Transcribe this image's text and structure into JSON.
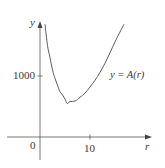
{
  "chart_data": {
    "type": "line",
    "title": "",
    "xlabel": "r",
    "ylabel": "y",
    "function_label": "y = A(r)",
    "origin_label": "0",
    "x_ticks": [
      {
        "value": 10,
        "label": "10"
      }
    ],
    "y_ticks": [
      {
        "value": 1000,
        "label": "1000"
      }
    ],
    "xlim": [
      -3.5,
      22
    ],
    "ylim": [
      -400,
      1850
    ],
    "grid": false,
    "legend": "none",
    "series": [
      {
        "name": "y = A(r)",
        "x": [
          1.0,
          1.5,
          2.0,
          2.5,
          3.0,
          3.5,
          4.0,
          4.5,
          5.0,
          5.42,
          6.0,
          7.0,
          8.0,
          9.0,
          10.0,
          11.0,
          12.0,
          13.0,
          14.0,
          15.0,
          16.8
        ],
        "values": [
          1850,
          1500,
          1300,
          1100,
          960,
          850,
          740,
          690,
          620,
          550,
          580,
          590,
          650,
          720,
          820,
          930,
          1060,
          1210,
          1380,
          1560,
          1850
        ]
      }
    ],
    "colors": {
      "curve": "#4a4a4a",
      "axes": "#4a4a4a",
      "text": "#3a3a3a"
    }
  },
  "labels": {
    "y_axis": "y",
    "x_axis": "r",
    "origin": "0",
    "tick_x_10": "10",
    "tick_y_1000": "1000",
    "curve_name": "y = A(r)"
  }
}
